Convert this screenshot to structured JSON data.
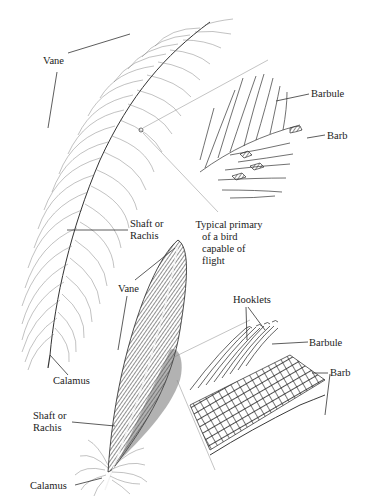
{
  "diagram": {
    "background": "#ffffff",
    "ink_color": "#2a2a2a",
    "upper_feather": {
      "description": "Downy / contour feather with loose vane",
      "labels": {
        "vane": "Vane",
        "shaft_line1": "Shaft or",
        "shaft_line2": "Rachis",
        "calamus": "Calamus"
      },
      "detail_inset": {
        "description": "Magnified barbs without hooklets",
        "labels": {
          "barbule": "Barbule",
          "barb": "Barb"
        }
      }
    },
    "lower_feather": {
      "description": "Flight feather",
      "caption_line1": "Typical primary",
      "caption_line2": "of a bird",
      "caption_line3": "capable of",
      "caption_line4": "flight",
      "labels": {
        "vane": "Vane",
        "shaft_line1": "Shaft or",
        "shaft_line2": "Rachis",
        "calamus": "Calamus"
      },
      "detail_inset": {
        "description": "Magnified interlocking barbs with hooklets",
        "labels": {
          "hooklets": "Hooklets",
          "barbule": "Barbule",
          "barb": "Barb"
        }
      }
    }
  }
}
